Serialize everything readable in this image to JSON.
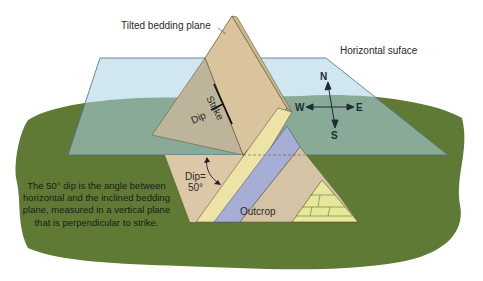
{
  "diagram": {
    "type": "geology-strike-dip",
    "labels": {
      "tilted_plane": "Tilted bedding plane",
      "horizontal_surface": "Horizontal suface",
      "strike": "Strike",
      "dip": "Dip",
      "dip_angle_line1": "Dip=",
      "dip_angle_line2": "50°",
      "outcrop": "Outcrop",
      "caption": "The 50° dip is the angle between horizontal and the inclined bedding plane, measured in a vertical plane that is perpendicular to strike."
    },
    "compass": {
      "north": "N",
      "south": "S",
      "east": "E",
      "west": "W"
    },
    "dip_angle_degrees": 50,
    "colors": {
      "horizontal_plane": "#b9dcea",
      "grass": "#5f7a35",
      "bedding_plane": "#d9c49e",
      "sandstone_layer": "#ece3a6",
      "shale_layer": "#a7aed6",
      "limestone_layer": "#e7e99a"
    }
  }
}
